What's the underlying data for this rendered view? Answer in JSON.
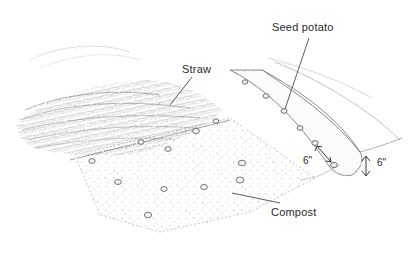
{
  "diagram": {
    "labels": {
      "straw": "Straw",
      "seed_potato": "Seed potato",
      "compost": "Compost",
      "depth_spacing": "6\"",
      "height": "6\""
    },
    "regions": [
      {
        "name": "straw-mulch",
        "label_ref": "straw"
      },
      {
        "name": "compost-bed",
        "label_ref": "compost"
      },
      {
        "name": "raised-row",
        "label_ref": "seed_potato"
      }
    ],
    "dimensions": [
      {
        "name": "spacing-between-seed-potatoes",
        "value": "6\""
      },
      {
        "name": "row-height",
        "value": "6\""
      }
    ],
    "colors": {
      "ink": "#2a2a2a",
      "pencil_dark": "#6b6b6b",
      "pencil_light": "#b5b5b5",
      "background": "#ffffff"
    }
  }
}
